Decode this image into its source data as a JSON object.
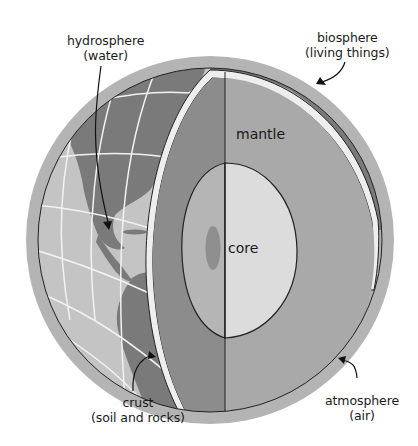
{
  "diagram": {
    "labels": {
      "hydrosphere": {
        "line1": "hydrosphere",
        "line2": "(water)"
      },
      "biosphere": {
        "line1": "biosphere",
        "line2": "(living things)"
      },
      "crust": {
        "line1": "crust",
        "line2": "(soil and rocks)"
      },
      "atmosphere": {
        "line1": "atmosphere",
        "line2": "(air)"
      },
      "mantle": "mantle",
      "core": "core"
    },
    "colors": {
      "atmosphere": "#b4b4b4",
      "ocean": "#c4c4c4",
      "land": "#7a7a7a",
      "grid": "#f2f2f2",
      "crust_band": "#eeeeee",
      "mantle_left": "#8c8c8c",
      "mantle_right": "#a9a9a9",
      "core_left": "#b5b5b5",
      "core_right": "#dcdcdc",
      "inner_core": "#8f8f8f",
      "outline": "#222222"
    }
  }
}
